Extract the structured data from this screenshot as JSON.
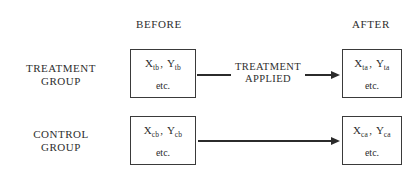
{
  "headers": {
    "before": "BEFORE",
    "after": "AFTER"
  },
  "rows": [
    {
      "label_line1": "TREATMENT",
      "label_line2": "GROUP",
      "before_box": {
        "var1_base": "X",
        "var1_sub": "tb",
        "var2_base": "Y",
        "var2_sub": "tb",
        "separator": ",",
        "etc": "etc."
      },
      "after_box": {
        "var1_base": "X",
        "var1_sub": "ta",
        "var2_base": "Y",
        "var2_sub": "ta",
        "separator": ",",
        "etc": "etc."
      },
      "connector_caption_line1": "TREATMENT",
      "connector_caption_line2": "APPLIED"
    },
    {
      "label_line1": "CONTROL",
      "label_line2": "GROUP",
      "before_box": {
        "var1_base": "X",
        "var1_sub": "cb",
        "var2_base": "Y",
        "var2_sub": "cb",
        "separator": ",",
        "etc": "etc."
      },
      "after_box": {
        "var1_base": "X",
        "var1_sub": "ca",
        "var2_base": "Y",
        "var2_sub": "ca",
        "separator": ",",
        "etc": "etc."
      },
      "connector_caption_line1": "",
      "connector_caption_line2": ""
    }
  ],
  "colors": {
    "ink": "#2b2b2b",
    "box_border": "#3a3a3a",
    "background": "#ffffff"
  }
}
